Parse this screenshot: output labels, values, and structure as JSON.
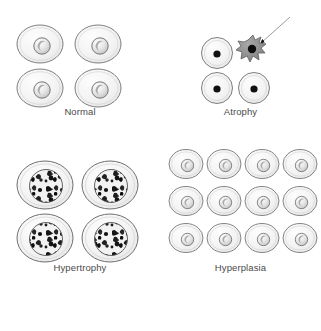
{
  "figure": {
    "background_color": "#ffffff",
    "outline_color": "#7a7a7a",
    "cell_fill_color": "#f4f4f4",
    "nucleus_dark_color": "#1a1a1a",
    "apoptotic_body_color": "#8c8c8c",
    "label_text_color": "#4a4a4a"
  },
  "panels": [
    {
      "id": "normal",
      "label": "Normal",
      "cell_count": 4,
      "grid": "2x2",
      "cell_type": "normal-cell",
      "description": "Four medium oval cells with small pale nuclei"
    },
    {
      "id": "atrophy",
      "label": "Atrophy",
      "cell_count": 3,
      "grid": "2x2-with-apoptotic",
      "cell_type": "atrophic-cell",
      "description": "Three shrunken round cells with small dense dark nuclei plus one apoptotic cell"
    },
    {
      "id": "hypertrophy",
      "label": "Hypertrophy",
      "cell_count": 4,
      "grid": "2x2",
      "cell_type": "hypertrophic-cell",
      "description": "Four enlarged cells with large mottled nuclei"
    },
    {
      "id": "hyperplasia",
      "label": "Hyperplasia",
      "cell_count": 12,
      "grid": "4x3",
      "cell_type": "normal-cell",
      "description": "Twelve normal-sized cells, increased in number"
    }
  ],
  "annotations": [
    {
      "id": "apoptotic-cell",
      "line1": "Apoptotic",
      "line2": "cell",
      "points_to": "apoptotic-body",
      "leader": "arrow"
    }
  ]
}
